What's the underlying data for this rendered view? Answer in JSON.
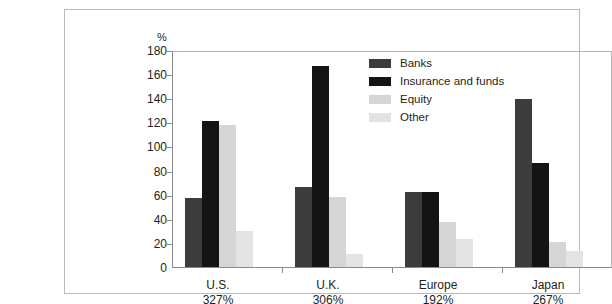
{
  "chart_data": {
    "type": "bar",
    "title": "",
    "subtitle": "",
    "xlabel": "",
    "ylabel": "%",
    "ylim": [
      0,
      180
    ],
    "yticks": [
      0,
      20,
      40,
      60,
      80,
      100,
      120,
      140,
      160,
      180
    ],
    "grid": false,
    "legend_position": "inside-top-center",
    "categories": [
      "U.S.",
      "U.K.",
      "Europe",
      "Japan"
    ],
    "category_totals": [
      "327%",
      "306%",
      "192%",
      "267%"
    ],
    "series": [
      {
        "name": "Banks",
        "color": "#3c3c3c",
        "values": [
          57,
          66,
          62,
          139
        ]
      },
      {
        "name": "Insurance and funds",
        "color": "#141414",
        "values": [
          121,
          167,
          62,
          86
        ]
      },
      {
        "name": "Equity",
        "color": "#d5d5d5",
        "values": [
          118,
          58,
          37,
          21
        ]
      },
      {
        "name": "Other",
        "color": "#e3e3e3",
        "values": [
          30,
          11,
          23,
          13
        ]
      }
    ]
  },
  "axis": {
    "unit": "%",
    "tick_labels": [
      "180",
      "160",
      "140",
      "120",
      "100",
      "80",
      "60",
      "40",
      "20",
      "0"
    ]
  },
  "legend": {
    "items": [
      {
        "label": "Banks",
        "color": "#3c3c3c"
      },
      {
        "label": "Insurance and funds",
        "color": "#141414"
      },
      {
        "label": "Equity",
        "color": "#d5d5d5"
      },
      {
        "label": "Other",
        "color": "#e3e3e3"
      }
    ]
  },
  "xaxis": {
    "groups": [
      {
        "name": "U.S.",
        "percent": "327%"
      },
      {
        "name": "U.K.",
        "percent": "306%"
      },
      {
        "name": "Europe",
        "percent": "192%"
      },
      {
        "name": "Japan",
        "percent": "267%"
      }
    ]
  }
}
